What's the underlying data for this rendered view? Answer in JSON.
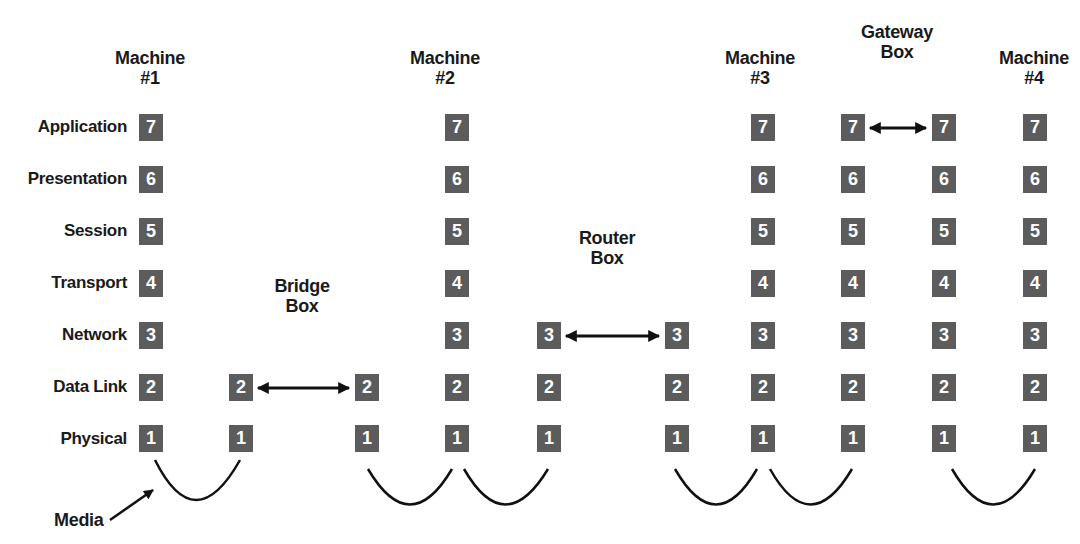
{
  "diagram": {
    "layers": [
      {
        "number": "7",
        "name": "Application"
      },
      {
        "number": "6",
        "name": "Presentation"
      },
      {
        "number": "5",
        "name": "Session"
      },
      {
        "number": "4",
        "name": "Transport"
      },
      {
        "number": "3",
        "name": "Network"
      },
      {
        "number": "2",
        "name": "Data Link"
      },
      {
        "number": "1",
        "name": "Physical"
      }
    ],
    "headers": [
      {
        "line1": "Machine",
        "line2": "#1"
      },
      {
        "line1": "Machine",
        "line2": "#2"
      },
      {
        "line1": "Machine",
        "line2": "#3"
      },
      {
        "line1": "Machine",
        "line2": "#4"
      },
      {
        "line1": "Bridge",
        "line2": "Box"
      },
      {
        "line1": "Router",
        "line2": "Box"
      },
      {
        "line1": "Gateway",
        "line2": "Box"
      }
    ],
    "media_label": "Media",
    "box_color": "#5c5c5c",
    "stacks": [
      {
        "name": "machine-1",
        "layers": [
          "7",
          "6",
          "5",
          "4",
          "3",
          "2",
          "1"
        ]
      },
      {
        "name": "bridge-left",
        "layers": [
          "2",
          "1"
        ]
      },
      {
        "name": "bridge-right",
        "layers": [
          "2",
          "1"
        ]
      },
      {
        "name": "machine-2",
        "layers": [
          "7",
          "6",
          "5",
          "4",
          "3",
          "2",
          "1"
        ]
      },
      {
        "name": "router-left",
        "layers": [
          "3",
          "2",
          "1"
        ]
      },
      {
        "name": "router-right",
        "layers": [
          "3",
          "2",
          "1"
        ]
      },
      {
        "name": "machine-3",
        "layers": [
          "7",
          "6",
          "5",
          "4",
          "3",
          "2",
          "1"
        ]
      },
      {
        "name": "gateway-left",
        "layers": [
          "7",
          "6",
          "5",
          "4",
          "3",
          "2",
          "1"
        ]
      },
      {
        "name": "gateway-right",
        "layers": [
          "7",
          "6",
          "5",
          "4",
          "3",
          "2",
          "1"
        ]
      },
      {
        "name": "machine-4",
        "layers": [
          "7",
          "6",
          "5",
          "4",
          "3",
          "2",
          "1"
        ]
      }
    ]
  }
}
